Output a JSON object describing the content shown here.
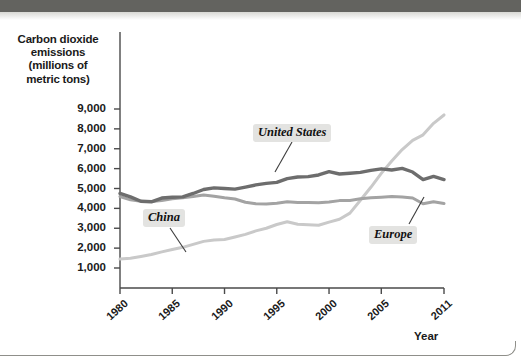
{
  "figure": {
    "y_axis_title_lines": [
      "Carbon dioxide",
      "emissions",
      "(millions of",
      "metric tons)"
    ],
    "x_axis_title": "Year"
  },
  "chart_data": {
    "type": "line",
    "title": "",
    "xlabel": "Year",
    "ylabel": "Carbon dioxide emissions (millions of metric tons)",
    "xlim": [
      1980,
      2011
    ],
    "ylim": [
      0,
      9600
    ],
    "grid": false,
    "legend": "inline-annotations",
    "ytick_labels": [
      "9,000",
      "8,000",
      "7,000",
      "6,000",
      "5,000",
      "4,000",
      "3,000",
      "2,000",
      "1,000"
    ],
    "ytick_values": [
      9000,
      8000,
      7000,
      6000,
      5000,
      4000,
      3000,
      2000,
      1000
    ],
    "xtick_labels": [
      "1980",
      "1985",
      "1990",
      "1995",
      "2000",
      "2005",
      "2011"
    ],
    "xtick_values": [
      1980,
      1985,
      1990,
      1995,
      2000,
      2005,
      2011
    ],
    "x": [
      1980,
      1981,
      1982,
      1983,
      1984,
      1985,
      1986,
      1987,
      1988,
      1989,
      1990,
      1991,
      1992,
      1993,
      1994,
      1995,
      1996,
      1997,
      1998,
      1999,
      2000,
      2001,
      2002,
      2003,
      2004,
      2005,
      2006,
      2007,
      2008,
      2009,
      2010,
      2011
    ],
    "series": [
      {
        "name": "United States",
        "color": "#6d6d6d",
        "values": [
          4750,
          4580,
          4360,
          4330,
          4520,
          4560,
          4580,
          4750,
          4950,
          5030,
          5000,
          4970,
          5070,
          5180,
          5260,
          5310,
          5500,
          5580,
          5600,
          5680,
          5850,
          5730,
          5770,
          5810,
          5910,
          5990,
          5930,
          6010,
          5830,
          5450,
          5610,
          5450
        ]
      },
      {
        "name": "Europe",
        "color": "#a3a3a3",
        "values": [
          4600,
          4430,
          4360,
          4340,
          4400,
          4480,
          4530,
          4600,
          4670,
          4610,
          4530,
          4470,
          4310,
          4230,
          4220,
          4260,
          4330,
          4290,
          4300,
          4280,
          4320,
          4390,
          4400,
          4480,
          4530,
          4560,
          4600,
          4570,
          4520,
          4230,
          4330,
          4250
        ]
      },
      {
        "name": "China",
        "color": "#c9c9c9",
        "values": [
          1450,
          1490,
          1580,
          1680,
          1810,
          1930,
          2040,
          2190,
          2340,
          2410,
          2430,
          2560,
          2690,
          2870,
          3000,
          3190,
          3330,
          3200,
          3180,
          3150,
          3310,
          3450,
          3760,
          4410,
          5060,
          5760,
          6380,
          6960,
          7420,
          7700,
          8280,
          8700
        ]
      }
    ],
    "annotations": [
      {
        "text": "United States",
        "series": "United States",
        "x": 1995.2,
        "label_y": 7400
      },
      {
        "text": "China",
        "series": "China",
        "x": 1983.6,
        "label_y": 3200
      },
      {
        "text": "Europe",
        "series": "Europe",
        "x": 2007.4,
        "label_y": 2700
      }
    ]
  }
}
